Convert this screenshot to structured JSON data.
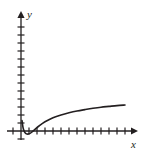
{
  "figure": {
    "background_color": "#ffffff",
    "ink_color": "#231f20",
    "width": 144,
    "height": 155
  },
  "axes": {
    "x_label": "x",
    "y_label": "y",
    "origin_px": {
      "x": 21,
      "y": 131
    },
    "x_axis": {
      "start_px": 7,
      "end_px": 137,
      "arrow": "right-arrow-icon",
      "tick_spacing_px": 8,
      "tick_length_px": 7,
      "tick_count_left_of_origin": 1,
      "tick_count_right_of_origin": 13
    },
    "y_axis": {
      "start_px": 140,
      "end_px": 12,
      "arrow": "up-arrow-icon",
      "tick_spacing_px": 8,
      "tick_length_px": 7,
      "tick_count_above_origin": 14,
      "tick_count_below_origin": 1
    }
  },
  "chart_data": {
    "type": "line",
    "title": "",
    "xlabel": "x",
    "ylabel": "y",
    "grid": false,
    "legend": null,
    "axis_style": "arrow-axes-with-unit-ticks",
    "xlim": [
      -1.75,
      14.5
    ],
    "ylim": [
      -1.5,
      15
    ],
    "series": [
      {
        "name": "curve",
        "x": [
          0.13,
          0.25,
          0.38,
          0.5,
          0.63,
          0.75,
          0.88,
          1.0,
          1.13,
          1.38,
          1.75,
          2.25,
          3.0,
          4.0,
          5.0,
          6.0,
          7.0,
          8.0,
          9.0,
          10.0,
          11.0,
          12.0,
          13.0
        ],
        "y": [
          1.3,
          0.45,
          0.02,
          -0.2,
          -0.32,
          -0.37,
          -0.38,
          -0.35,
          -0.3,
          -0.12,
          0.2,
          0.62,
          1.15,
          1.65,
          2.0,
          2.28,
          2.5,
          2.68,
          2.84,
          2.97,
          3.08,
          3.18,
          3.25
        ],
        "color": "#231f20",
        "line_width_px": 1.6,
        "style": "solid"
      }
    ],
    "points_px": [
      [
        22.0,
        120.5
      ],
      [
        23.0,
        127.4
      ],
      [
        24.0,
        130.8
      ],
      [
        25.0,
        132.6
      ],
      [
        26.0,
        133.6
      ],
      [
        27.0,
        134.0
      ],
      [
        28.0,
        134.1
      ],
      [
        29.0,
        133.8
      ],
      [
        30.0,
        133.4
      ],
      [
        32.0,
        132.0
      ],
      [
        35.0,
        129.4
      ],
      [
        39.0,
        126.0
      ],
      [
        45.0,
        121.8
      ],
      [
        53.0,
        117.8
      ],
      [
        61.0,
        115.0
      ],
      [
        69.0,
        112.8
      ],
      [
        77.0,
        111.0
      ],
      [
        85.0,
        109.6
      ],
      [
        93.0,
        108.3
      ],
      [
        101.0,
        107.2
      ],
      [
        109.0,
        106.4
      ],
      [
        117.0,
        105.6
      ],
      [
        125.0,
        105.0
      ]
    ]
  }
}
